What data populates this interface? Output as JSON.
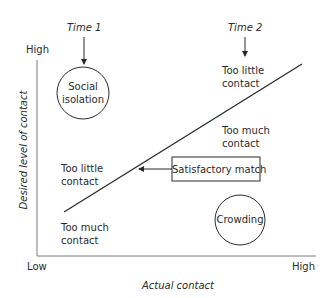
{
  "diagram": {
    "type": "concept-graph",
    "axes": {
      "x_label": "Actual contact",
      "y_label": "Desired level of contact",
      "x_low": "Low",
      "x_high": "High",
      "y_high": "High"
    },
    "time_markers": [
      {
        "label": "Time 1"
      },
      {
        "label": "Time 2"
      }
    ],
    "circles": [
      {
        "label_line1": "Social",
        "label_line2": "isolation"
      },
      {
        "label": "Crowding"
      }
    ],
    "regions": [
      {
        "line1": "Too little",
        "line2": "contact",
        "position": "upper-right"
      },
      {
        "line1": "Too much",
        "line2": "contact",
        "position": "middle-right"
      },
      {
        "line1": "Too little",
        "line2": "contact",
        "position": "middle-left"
      },
      {
        "line1": "Too much",
        "line2": "contact",
        "position": "lower-left"
      }
    ],
    "callout": {
      "label": "Satisfactory match"
    },
    "colors": {
      "stroke": "#2a2a2a",
      "axis": "#7a7a7a",
      "text": "#2a2a2a"
    }
  }
}
